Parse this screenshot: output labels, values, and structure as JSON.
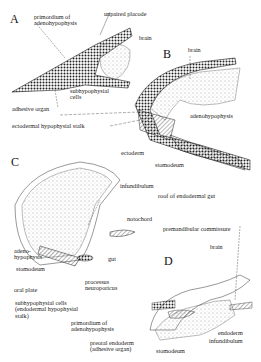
{
  "figure": {
    "panels": [
      {
        "id": "A",
        "labels": {
          "primordium": "primordium of",
          "primordium2": "adenohypophysis",
          "unpaired": "unpaired placode",
          "brain": "brain",
          "subhypo": "subhypophysial",
          "subhypo2": "cells"
        }
      },
      {
        "id": "B",
        "labels": {
          "brain": "brain",
          "adeno": "adenohypophysis",
          "ectoderm": "ectoderm",
          "stomodeum": "stomodeum",
          "roof": "roof of endodermal gut"
        }
      },
      {
        "id": "C",
        "labels": {
          "infundibulum": "infundibulum",
          "notochord": "notochord",
          "adeno": "adeno-",
          "adeno2": "hypophysis",
          "stomodeum": "stomodeum",
          "gut": "gut",
          "oralplate": "oral plate",
          "processus": "processus",
          "processus2": "neuroporicus",
          "subhypo": "subhypophysial cells",
          "subhypo2": "(endodermal hypophysial",
          "subhypo3": "stalk)"
        }
      },
      {
        "id": "D",
        "labels": {
          "premand": "premandibular commissure",
          "brain": "brain",
          "primordium": "primordium of",
          "primordium2": "adenohypophysis",
          "preoral": "preoral endoderm",
          "preoral2": "(adhesive organ)",
          "stomodeum": "stomodeum",
          "endoderm": "endoderm",
          "infundibulum": "infundibulum"
        }
      }
    ],
    "shared_labels": {
      "adhesive": "adhesive organ",
      "ectodermal": "ectodermal hypophysial stalk"
    }
  }
}
